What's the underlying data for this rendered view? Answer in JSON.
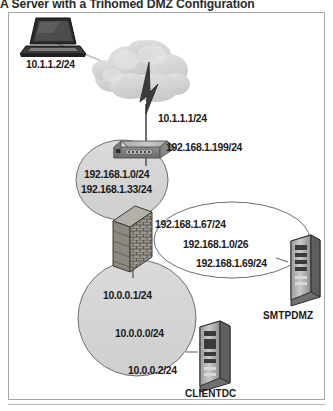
{
  "caption": "A Server with a Trihomed DMZ Configuration",
  "figure": {
    "nodes": {
      "laptop": {
        "icon": "laptop-icon",
        "label": "10.1.1.2/24"
      },
      "cloud": {
        "icon": "cloud-icon",
        "label": "10.1.1.1/24"
      },
      "lightning": {
        "icon": "lightning-bolt-icon"
      },
      "switch": {
        "icon": "switch-icon",
        "label": "192.168.1.199/24"
      },
      "firewall": {
        "icon": "firewall-brick-wall-icon"
      },
      "smtp_server": {
        "icon": "server-tower-icon",
        "label": "SMTPDMZ"
      },
      "client_server": {
        "icon": "server-tower-icon",
        "label": "CLIENTDC"
      }
    },
    "zones": {
      "internal_upper": {
        "name": "upper-network-zone",
        "labels": [
          "192.168.1.0/24",
          "192.168.1.33/24"
        ]
      },
      "dmz": {
        "name": "dmz-zone",
        "labels": [
          "192.168.1.67/24",
          "192.168.1.0/26",
          "192.168.1.69/24"
        ]
      },
      "internal_lower": {
        "name": "lower-network-zone",
        "labels": [
          "10.0.0.1/24",
          "10.0.0.0/24",
          "10.0.0.2/24"
        ]
      }
    }
  },
  "colors": {
    "zone_fill": "#d3d3d3",
    "zone_stroke": "#6e6e6e",
    "dmz_fill": "#ffffff",
    "cloud_fill": "#d8d8d8",
    "frame_stroke": "#a6a6a6",
    "text": "#1a1a1a"
  }
}
